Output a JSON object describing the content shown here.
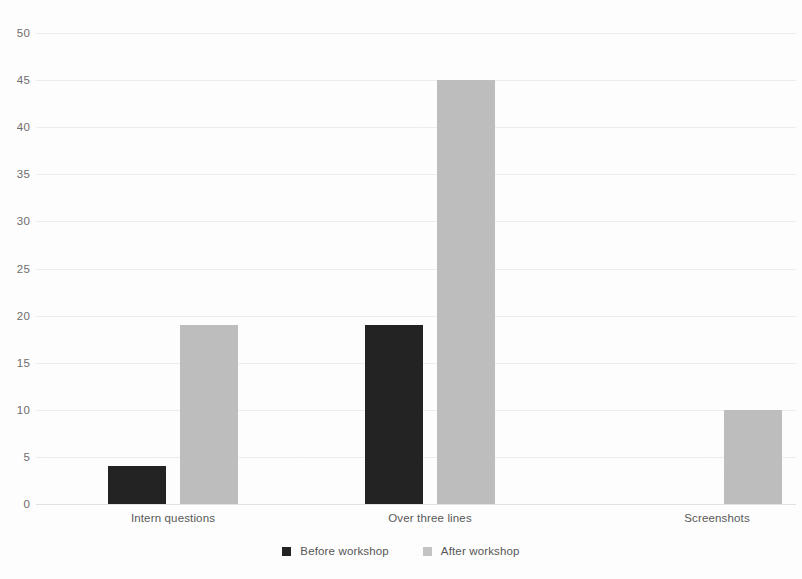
{
  "chart_data": {
    "type": "bar",
    "title": "",
    "subtitle": "",
    "xlabel": "",
    "ylabel": "",
    "categories": [
      "Intern questions",
      "Over three lines",
      "Screenshots"
    ],
    "series": [
      {
        "name": "Before workshop",
        "values": [
          4,
          19,
          0
        ],
        "color": "#232323"
      },
      {
        "name": "After workshop",
        "values": [
          19,
          45,
          10
        ],
        "color": "#bdbdbd"
      }
    ],
    "ylim": [
      0,
      50
    ],
    "ytick_values": [
      0,
      5,
      10,
      15,
      20,
      25,
      30,
      35,
      40,
      45,
      50
    ],
    "ytick_labels": [
      "0",
      "5",
      "10",
      "15",
      "20",
      "25",
      "30",
      "35",
      "40",
      "45",
      "50"
    ],
    "grid": true,
    "grid_axis": "y",
    "legend_position": "bottom",
    "annotations": []
  },
  "legend": {
    "items": [
      {
        "label": "Before workshop",
        "swatch": "legend-swatch-before"
      },
      {
        "label": "After workshop",
        "swatch": "legend-swatch-after"
      }
    ]
  },
  "colors": {
    "before": "#232323",
    "after": "#bdbdbd",
    "grid": "#ededed",
    "tick_text": "#6d6d6d",
    "category_text": "#585858",
    "background": "#fdfdfd"
  }
}
